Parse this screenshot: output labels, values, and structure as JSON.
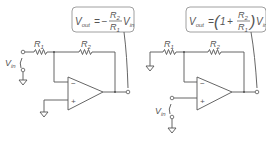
{
  "diagrams": [
    {
      "name": "inverting-amplifier",
      "equation": {
        "lhs": "V",
        "lhs_sub": "out",
        "eq": "=",
        "sign": "−",
        "num": "R",
        "num_sub": "2",
        "den": "R",
        "den_sub": "1",
        "tail": "V",
        "tail_sub": "in"
      },
      "labels": {
        "r1": "R",
        "r1_sub": "1",
        "r2": "R",
        "r2_sub": "2",
        "vin": "V",
        "vin_sub": "in",
        "minus": "−",
        "plus": "+"
      }
    },
    {
      "name": "non-inverting-amplifier",
      "equation": {
        "lhs": "V",
        "lhs_sub": "out",
        "eq": "=",
        "lparen": "(",
        "one": "1",
        "plus": "+",
        "num": "R",
        "num_sub": "2",
        "den": "R",
        "den_sub": "1",
        "rparen": ")",
        "tail": "V",
        "tail_sub": "in"
      },
      "labels": {
        "r1": "R",
        "r1_sub": "1",
        "r2": "R",
        "r2_sub": "2",
        "vin": "V",
        "vin_sub": "in",
        "minus": "−",
        "plus": "+"
      }
    }
  ]
}
